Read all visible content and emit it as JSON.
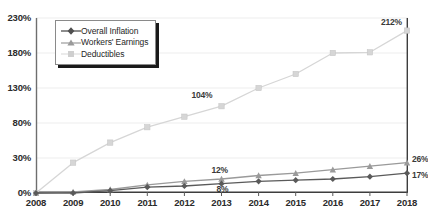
{
  "chart_data": {
    "type": "line",
    "title": "",
    "subtitle": "",
    "xlabel": "",
    "ylabel": "",
    "x": [
      "2008",
      "2009",
      "2010",
      "2011",
      "2012",
      "2013",
      "2014",
      "2015",
      "2016",
      "2017",
      "2018"
    ],
    "ylim": [
      0,
      230
    ],
    "y_ticks": [
      "0%",
      "30%",
      "80%",
      "130%",
      "180%",
      "230%"
    ],
    "y_tick_values": [
      0,
      30,
      80,
      130,
      180,
      230
    ],
    "grid": true,
    "legend_position": "top-left",
    "series": [
      {
        "name": "Overall Inflation",
        "marker": "diamond",
        "color": "#5a5a5a",
        "values": [
          0,
          0,
          2,
          5,
          6,
          8,
          10,
          11,
          12,
          14,
          17
        ]
      },
      {
        "name": "Workers' Earnings",
        "marker": "triangle",
        "color": "#9a9a9a",
        "values": [
          0,
          1,
          3,
          7,
          10,
          12,
          15,
          17,
          20,
          23,
          26
        ]
      },
      {
        "name": "Deductibles",
        "marker": "square",
        "color": "#d6d6d6",
        "values": [
          0,
          26,
          52,
          74,
          89,
          104,
          130,
          150,
          180,
          181,
          212
        ]
      }
    ],
    "annotations": [
      {
        "text": "212%",
        "series": "Deductibles",
        "x": "2018",
        "value": 212
      },
      {
        "text": "104%",
        "series": "Deductibles",
        "x": "2013",
        "value": 104
      },
      {
        "text": "12%",
        "series": "Workers' Earnings",
        "x": "2013",
        "value": 12
      },
      {
        "text": "8%",
        "series": "Overall Inflation",
        "x": "2013",
        "value": 8
      },
      {
        "text": "26%",
        "series": "Workers' Earnings",
        "x": "2018",
        "value": 26
      },
      {
        "text": "17%",
        "series": "Overall Inflation",
        "x": "2018",
        "value": 17
      }
    ]
  }
}
